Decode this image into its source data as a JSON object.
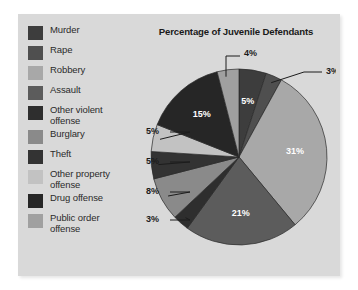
{
  "figure": {
    "background_color": "#d9d9d9",
    "title": "Percentage of Juvenile Defendants"
  },
  "legend": {
    "items": [
      {
        "label": "Murder",
        "color": "#3d3d3d"
      },
      {
        "label": "Rape",
        "color": "#4f4f4f"
      },
      {
        "label": "Robbery",
        "color": "#a8a8a8"
      },
      {
        "label": "Assault",
        "color": "#5c5c5c"
      },
      {
        "label": "Other violent\noffense",
        "color": "#2e2e2e"
      },
      {
        "label": "Burglary",
        "color": "#8a8a8a"
      },
      {
        "label": "Theft",
        "color": "#333333"
      },
      {
        "label": "Other property\noffense",
        "color": "#c2c2c2"
      },
      {
        "label": "Drug offense",
        "color": "#262626"
      },
      {
        "label": "Public order\noffense",
        "color": "#a0a0a0"
      }
    ]
  },
  "chart_data": {
    "type": "pie",
    "title": "Percentage of Juvenile Defendants",
    "legend_position": "left",
    "total": 100,
    "units": "percent",
    "categories": [
      "Murder",
      "Rape",
      "Robbery",
      "Assault",
      "Other violent offense",
      "Burglary",
      "Theft",
      "Other property offense",
      "Drug offense",
      "Public order offense"
    ],
    "values": [
      5,
      3,
      31,
      21,
      3,
      8,
      5,
      5,
      15,
      4
    ],
    "labels": [
      "5%",
      "3%",
      "31%",
      "21%",
      "3%",
      "8%",
      "5%",
      "5%",
      "15%",
      "4%"
    ],
    "colors": [
      "#3d3d3d",
      "#4f4f4f",
      "#a8a8a8",
      "#5c5c5c",
      "#2e2e2e",
      "#8a8a8a",
      "#333333",
      "#c2c2c2",
      "#262626",
      "#a0a0a0"
    ],
    "label_placement": [
      "inside",
      "callout",
      "inside",
      "inside",
      "callout",
      "callout",
      "callout",
      "callout",
      "inside",
      "callout"
    ]
  }
}
